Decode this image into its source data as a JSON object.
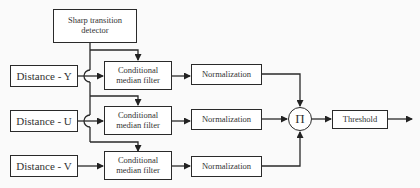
{
  "diagram": {
    "detector": "Sharp transition detector",
    "inputs": [
      "Distance - Y",
      "Distance - U",
      "Distance - V"
    ],
    "filter_label": "Conditional median filter",
    "normalization_label": "Normalization",
    "product_symbol": "Π",
    "threshold_label": "Threshold"
  }
}
